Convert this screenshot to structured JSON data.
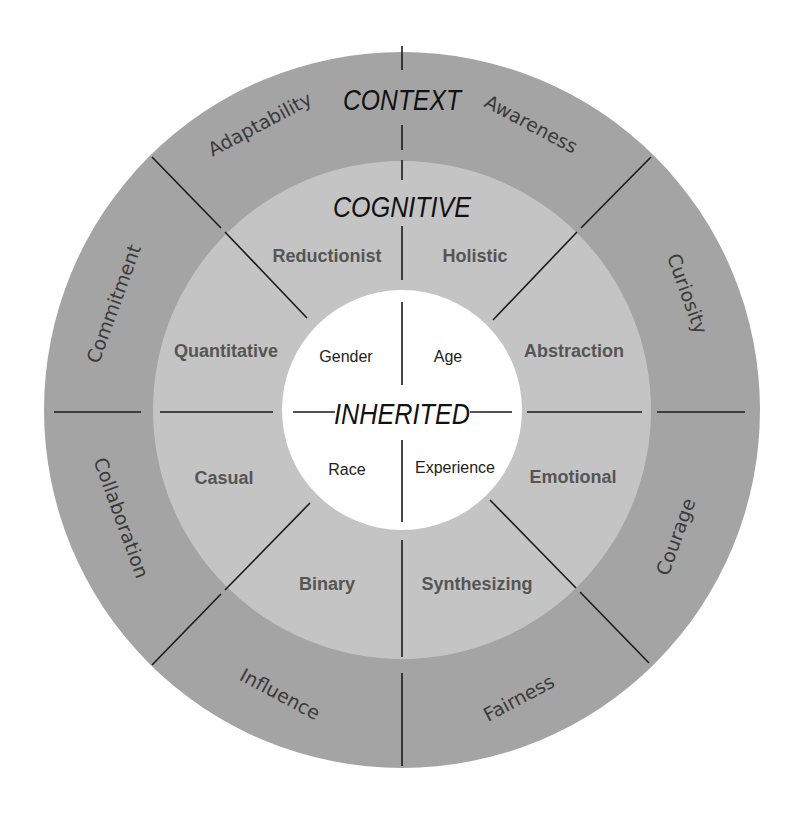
{
  "diagram": {
    "type": "concentric-circle-diagram",
    "colors": {
      "outer_ring": "#a4a4a4",
      "middle_ring": "#c4c4c4",
      "inner_circle": "#ffffff",
      "divider": "#1a1a1a",
      "title_text": "#111111",
      "middle_text": "#555555",
      "outer_text": "#3a3a3a"
    },
    "outer_ring": {
      "title": "CONTEXT",
      "segments": [
        {
          "label": "Awareness"
        },
        {
          "label": "Curiosity"
        },
        {
          "label": "Courage"
        },
        {
          "label": "Fairness"
        },
        {
          "label": "Influence"
        },
        {
          "label": "Collaboration"
        },
        {
          "label": "Commitment"
        },
        {
          "label": "Adaptability"
        }
      ]
    },
    "middle_ring": {
      "title": "COGNITIVE",
      "segments": [
        {
          "label": "Holistic"
        },
        {
          "label": "Abstraction"
        },
        {
          "label": "Emotional"
        },
        {
          "label": "Synthesizing"
        },
        {
          "label": "Binary"
        },
        {
          "label": "Casual"
        },
        {
          "label": "Quantitative"
        },
        {
          "label": "Reductionist"
        }
      ]
    },
    "inner_circle": {
      "title": "INHERITED",
      "segments": [
        {
          "label": "Age"
        },
        {
          "label": "Experience"
        },
        {
          "label": "Race"
        },
        {
          "label": "Gender"
        }
      ]
    }
  }
}
